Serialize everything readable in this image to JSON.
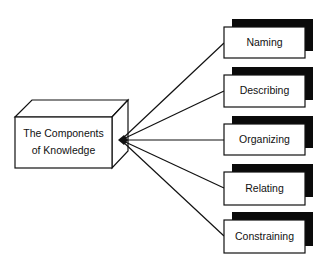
{
  "diagram": {
    "source": {
      "lines": [
        "The Components",
        "of Knowledge"
      ]
    },
    "targets": [
      {
        "label": "Naming",
        "y": 27
      },
      {
        "label": "Describing",
        "y": 75
      },
      {
        "label": "Organizing",
        "y": 124
      },
      {
        "label": "Relating",
        "y": 172
      },
      {
        "label": "Constraining",
        "y": 220
      }
    ],
    "colors": {
      "stroke": "#111111",
      "shadow": "#0a0a0a",
      "fill": "#ffffff"
    }
  }
}
